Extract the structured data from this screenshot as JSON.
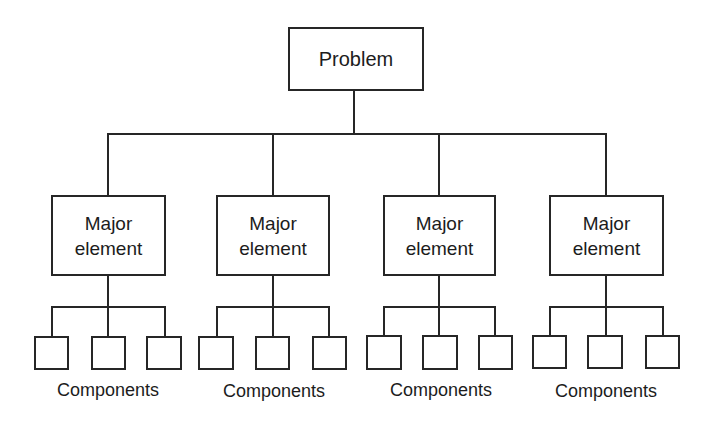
{
  "diagram": {
    "root": {
      "label": "Problem"
    },
    "majors": [
      {
        "line1": "Major",
        "line2": "element",
        "caption": "Components",
        "components": 3
      },
      {
        "line1": "Major",
        "line2": "element",
        "caption": "Components",
        "components": 3
      },
      {
        "line1": "Major",
        "line2": "element",
        "caption": "Components",
        "components": 3
      },
      {
        "line1": "Major",
        "line2": "element",
        "caption": "Components",
        "components": 3
      }
    ]
  }
}
